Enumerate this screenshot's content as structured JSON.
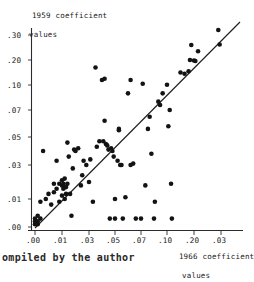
{
  "chart_data": {
    "type": "scatter",
    "title": "",
    "ylabel": "1959 coefficient values",
    "ylabel_line1": "1959 coefficient",
    "ylabel_line2": "values",
    "xlabel": "1966 coefficient values",
    "xlabel_line1": "1966 coefficient",
    "xlabel_line2": "values",
    "caption": "ompiled by the author",
    "grid": false,
    "legend": "none",
    "x_scale": "log-like (non-linear spacing)",
    "y_scale": "log-like (non-linear spacing)",
    "xticks": [
      ".00",
      ".01",
      ".03",
      ".05",
      ".07",
      ".10",
      ".20",
      ".03"
    ],
    "yticks": [
      ".00",
      ".01",
      ".03",
      ".05",
      ".07",
      ".10",
      ".20",
      ".30"
    ],
    "xlim": [
      0.0,
      0.3
    ],
    "ylim": [
      0.0,
      0.3
    ],
    "reference_line": {
      "description": "45-degree identity line y = x",
      "x0": 0.0,
      "y0": 0.0,
      "x1": 0.3,
      "y1": 0.3
    },
    "marker": "filled-circle",
    "marker_color": "#131313",
    "point_count": 96,
    "points": [
      [
        0.0,
        0.001
      ],
      [
        0.0,
        0.002
      ],
      [
        0.0,
        0.003
      ],
      [
        0.001,
        0.002
      ],
      [
        0.001,
        0.004
      ],
      [
        0.001,
        0.001
      ],
      [
        0.002,
        0.009
      ],
      [
        0.002,
        0.003
      ],
      [
        0.003,
        0.04
      ],
      [
        0.004,
        0.01
      ],
      [
        0.005,
        0.013
      ],
      [
        0.006,
        0.008
      ],
      [
        0.007,
        0.014
      ],
      [
        0.007,
        0.019
      ],
      [
        0.008,
        0.033
      ],
      [
        0.008,
        0.016
      ],
      [
        0.009,
        0.009
      ],
      [
        0.009,
        0.019
      ],
      [
        0.01,
        0.018
      ],
      [
        0.01,
        0.012
      ],
      [
        0.01,
        0.021
      ],
      [
        0.011,
        0.019
      ],
      [
        0.011,
        0.016
      ],
      [
        0.012,
        0.017
      ],
      [
        0.012,
        0.022
      ],
      [
        0.012,
        0.01
      ],
      [
        0.013,
        0.017
      ],
      [
        0.013,
        0.013
      ],
      [
        0.014,
        0.019
      ],
      [
        0.014,
        0.046
      ],
      [
        0.015,
        0.036
      ],
      [
        0.016,
        0.013
      ],
      [
        0.017,
        0.004
      ],
      [
        0.018,
        0.028
      ],
      [
        0.019,
        0.041
      ],
      [
        0.02,
        0.04
      ],
      [
        0.022,
        0.042
      ],
      [
        0.024,
        0.018
      ],
      [
        0.025,
        0.024
      ],
      [
        0.026,
        0.033
      ],
      [
        0.028,
        0.03
      ],
      [
        0.03,
        0.02
      ],
      [
        0.031,
        0.034
      ],
      [
        0.033,
        0.009
      ],
      [
        0.035,
        0.17
      ],
      [
        0.036,
        0.043
      ],
      [
        0.038,
        0.047
      ],
      [
        0.04,
        0.12
      ],
      [
        0.041,
        0.047
      ],
      [
        0.042,
        0.062
      ],
      [
        0.042,
        0.125
      ],
      [
        0.043,
        0.045
      ],
      [
        0.044,
        0.044
      ],
      [
        0.045,
        0.041
      ],
      [
        0.046,
        0.003
      ],
      [
        0.047,
        0.042
      ],
      [
        0.048,
        0.04
      ],
      [
        0.049,
        0.036
      ],
      [
        0.05,
        0.01
      ],
      [
        0.05,
        0.003
      ],
      [
        0.052,
        0.033
      ],
      [
        0.053,
        0.056
      ],
      [
        0.053,
        0.055
      ],
      [
        0.054,
        0.03
      ],
      [
        0.055,
        0.03
      ],
      [
        0.056,
        0.003
      ],
      [
        0.058,
        0.011
      ],
      [
        0.06,
        0.09
      ],
      [
        0.062,
        0.03
      ],
      [
        0.064,
        0.031
      ],
      [
        0.066,
        0.003
      ],
      [
        0.07,
        0.003
      ],
      [
        0.072,
        0.105
      ],
      [
        0.075,
        0.018
      ],
      [
        0.078,
        0.056
      ],
      [
        0.08,
        0.065
      ],
      [
        0.082,
        0.038
      ],
      [
        0.085,
        0.003
      ],
      [
        0.086,
        0.009
      ],
      [
        0.09,
        0.08
      ],
      [
        0.092,
        0.076
      ],
      [
        0.095,
        0.09
      ],
      [
        0.1,
        0.101
      ],
      [
        0.105,
        0.058
      ],
      [
        0.11,
        0.07
      ],
      [
        0.115,
        0.019
      ],
      [
        0.118,
        0.003
      ],
      [
        0.15,
        0.15
      ],
      [
        0.165,
        0.145
      ],
      [
        0.18,
        0.155
      ],
      [
        0.185,
        0.2
      ],
      [
        0.19,
        0.26
      ],
      [
        0.2,
        0.198
      ],
      [
        0.205,
        0.196
      ],
      [
        0.215,
        0.235
      ],
      [
        0.29,
        0.32
      ],
      [
        0.295,
        0.262
      ],
      [
        0.062,
        0.12
      ]
    ]
  }
}
